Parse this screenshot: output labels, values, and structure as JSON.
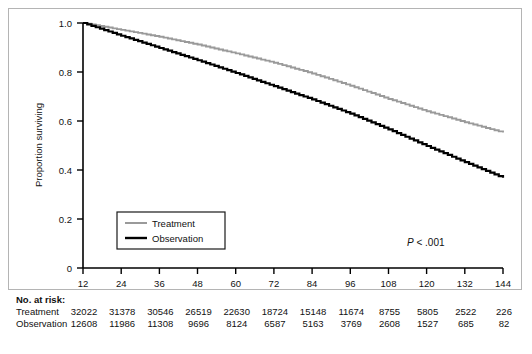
{
  "chart_data": {
    "type": "line",
    "title": "",
    "xlabel": "Overall survival (months)",
    "ylabel": "Proportion surviving",
    "xlim": [
      12,
      144
    ],
    "ylim": [
      0,
      1.0
    ],
    "xticks": [
      12,
      24,
      36,
      48,
      60,
      72,
      84,
      96,
      108,
      120,
      132,
      144
    ],
    "xticklabels": [
      "12",
      "24",
      "36",
      "48",
      "60",
      "72",
      "84",
      "96",
      "108",
      "120",
      "132",
      "144"
    ],
    "yticks": [
      0,
      0.2,
      0.4,
      0.6,
      0.8,
      1.0
    ],
    "yticklabels": [
      "0",
      "0.2",
      "0.4",
      "0.6",
      "0.8",
      "1.0"
    ],
    "grid": false,
    "legend_position": "lower-left-inside",
    "annotations": [
      {
        "name": "p-value",
        "text_prefix": "P",
        "text_rest": " < .001"
      }
    ],
    "x": [
      12,
      24,
      36,
      48,
      60,
      72,
      84,
      96,
      108,
      120,
      132,
      144
    ],
    "series": [
      {
        "name": "Treatment",
        "color": "#9a9a9a",
        "values": [
          1.0,
          0.972,
          0.944,
          0.912,
          0.876,
          0.838,
          0.794,
          0.744,
          0.69,
          0.64,
          0.595,
          0.553
        ]
      },
      {
        "name": "Observation",
        "color": "#000000",
        "values": [
          1.0,
          0.948,
          0.898,
          0.848,
          0.796,
          0.742,
          0.688,
          0.63,
          0.566,
          0.498,
          0.432,
          0.368
        ]
      }
    ]
  },
  "legend": {
    "entries": [
      {
        "label": "Treatment",
        "color": "#9a9a9a"
      },
      {
        "label": "Observation",
        "color": "#000000"
      }
    ]
  },
  "risk_table": {
    "title": "No. at risk:",
    "rows": [
      {
        "label": "Treatment",
        "values": [
          "32022",
          "31378",
          "30546",
          "26519",
          "22630",
          "18724",
          "15148",
          "11674",
          "8755",
          "5805",
          "2522",
          "226"
        ]
      },
      {
        "label": "Observation",
        "values": [
          "12608",
          "11986",
          "11308",
          "9696",
          "8124",
          "6587",
          "5163",
          "3769",
          "2608",
          "1527",
          "685",
          "82"
        ]
      }
    ]
  }
}
